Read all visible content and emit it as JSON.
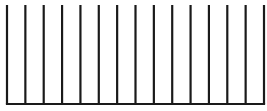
{
  "diagram": {
    "line_count": 15,
    "first_x": 7,
    "last_x": 264,
    "top_y": 5,
    "baseline_y": 104,
    "stroke_width": 2.2,
    "stroke_color": "#1a1a1a",
    "background": "#ffffff"
  }
}
